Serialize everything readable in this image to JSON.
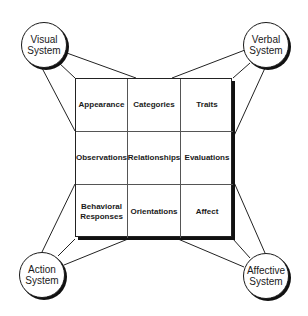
{
  "diagram": {
    "grid": {
      "rows": [
        [
          "Appearance",
          "Categories",
          "Traits"
        ],
        [
          "Observations",
          "Relationships",
          "Evaluations"
        ],
        [
          "Behavioral\nResponses",
          "Orientations",
          "Affect"
        ]
      ]
    },
    "nodes": {
      "visual": "Visual\nSystem",
      "verbal": "Verbal\nSystem",
      "action": "Action\nSystem",
      "affective": "Affective\nSystem"
    }
  }
}
